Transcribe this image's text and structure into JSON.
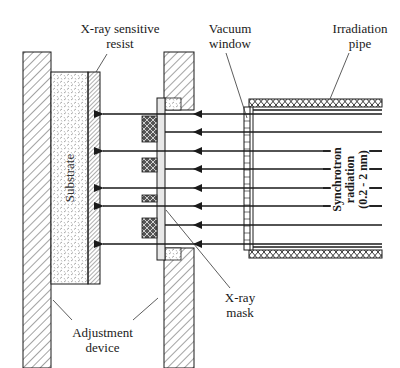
{
  "diagram": {
    "labels": {
      "resist": [
        "X-ray sensitive",
        "resist"
      ],
      "vacuum_window": [
        "Vacuum",
        "window"
      ],
      "irradiation_pipe": [
        "Irradiation",
        "pipe"
      ],
      "substrate": "Substrate",
      "synchrotron": [
        "Synchrotron",
        "radiation",
        "(0.2 - 2 nm)"
      ],
      "xray_mask": [
        "X-ray",
        "mask"
      ],
      "adjustment_device": [
        "Adjustment",
        "device"
      ]
    },
    "colors": {
      "line": "#1a1a1a",
      "background": "#ffffff",
      "mask_membrane": "#e8e8e8"
    },
    "components": [
      "adjustment-device-left",
      "substrate",
      "resist-layer",
      "adjustment-device-right",
      "mask-membrane",
      "absorber-patterns",
      "vacuum-window",
      "irradiation-pipe",
      "radiation-beams"
    ],
    "beam_count": 7,
    "absorber_count": 4
  }
}
